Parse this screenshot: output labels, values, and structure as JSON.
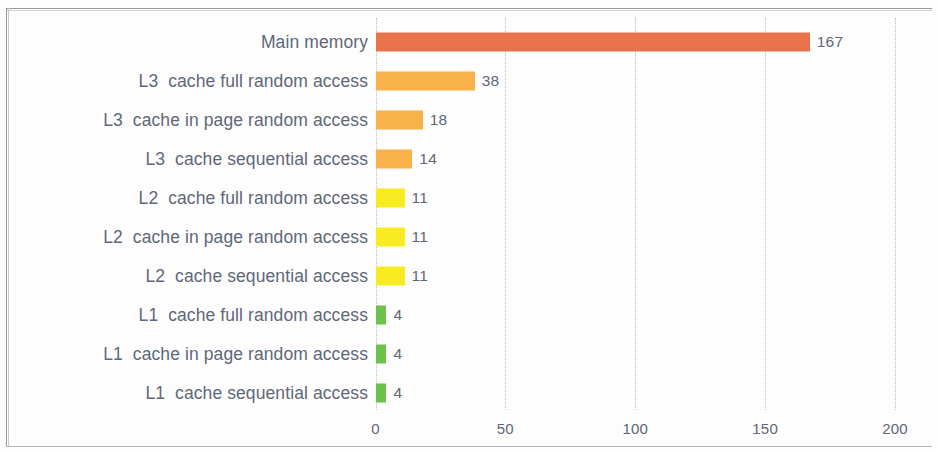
{
  "chart_data": {
    "type": "bar",
    "orientation": "horizontal",
    "title": "",
    "xlabel": "",
    "ylabel": "",
    "xlim": [
      0,
      200
    ],
    "xticks": [
      "0",
      "50",
      "100",
      "150",
      "200"
    ],
    "xtick_values": [
      0,
      50,
      100,
      150,
      200
    ],
    "grid": "vertical-dotted",
    "legend": "none",
    "categories": [
      "Main memory",
      "L3  cache full random access",
      "L3  cache in page random access",
      "L3  cache sequential access",
      "L2  cache full random access",
      "L2  cache in page random access",
      "L2  cache sequential access",
      "L1  cache full random access",
      "L1  cache in page random access",
      "L1  cache sequential access"
    ],
    "values": [
      167,
      38,
      18,
      14,
      11,
      11,
      11,
      4,
      4,
      4
    ],
    "value_labels": [
      "167",
      "38",
      "18",
      "14",
      "11",
      "11",
      "11",
      "4",
      "4",
      "4"
    ],
    "bar_colors": [
      "#e8734a",
      "#f9b24a",
      "#f9b24a",
      "#f9b24a",
      "#f8ec20",
      "#f8ec20",
      "#f8ec20",
      "#6cc24a",
      "#6cc24a",
      "#6cc24a"
    ]
  },
  "style": {
    "label_color": "#5f6878",
    "tick_color": "#5e6575",
    "grid_color": "#bfbfbf",
    "background": "#fdfdfd"
  }
}
